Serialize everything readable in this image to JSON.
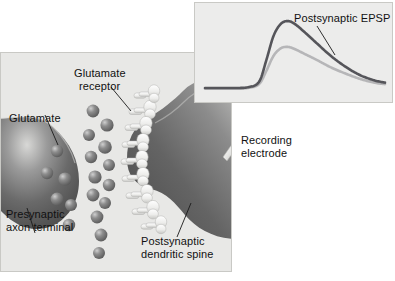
{
  "figure": {
    "background_color": "#ffffff"
  },
  "main_panel": {
    "name": "synapse-diagram",
    "background_color": "#e8e8e6",
    "border_color": "#c9c9c5",
    "labels": {
      "glutamate": "Glutamate",
      "glutamate_receptor_line1": "Glutamate",
      "glutamate_receptor_line2": "receptor",
      "presynaptic_line1": "Presynaptic",
      "presynaptic_line2": "axon terminal",
      "postsynaptic_line1": "Postsynaptic",
      "postsynaptic_line2": "dendritic spine",
      "recording_line1": "Recording",
      "recording_line2": "electrode"
    },
    "structures": {
      "presynaptic_terminal": "presynaptic-axon-terminal",
      "postsynaptic_spine": "postsynaptic-dendritic-spine",
      "synaptic_cleft": "synaptic-cleft",
      "neurotransmitter_count": 19,
      "receptor_count": 9,
      "neurotransmitter_color": "#7d7d7d",
      "receptor_color": "#f2f2f0",
      "membrane_color": "#6e6e6e"
    }
  },
  "inset_panel": {
    "name": "epsp-recording-inset",
    "background_color": "#ececeb",
    "border_color": "#c9c9c5",
    "label": "Postsynaptic EPSP"
  },
  "chart_data": {
    "type": "line",
    "title": "Postsynaptic EPSP",
    "xlabel": "",
    "ylabel": "",
    "grid": false,
    "legend": "annotation-leader-line",
    "xlim": [
      0,
      100
    ],
    "ylim": [
      0,
      100
    ],
    "x": [
      0,
      8,
      16,
      24,
      30,
      34,
      38,
      42,
      46,
      50,
      56,
      62,
      70,
      78,
      86,
      94,
      100
    ],
    "series": [
      {
        "name": "Postsynaptic EPSP (large)",
        "color": "#55555a",
        "linewidth": 2.6,
        "values": [
          4,
          4,
          4,
          5,
          12,
          40,
          72,
          88,
          92,
          88,
          76,
          63,
          46,
          32,
          21,
          14,
          11
        ]
      },
      {
        "name": "Postsynaptic EPSP (small)",
        "color": "#b6b6b8",
        "linewidth": 2.6,
        "values": [
          3,
          3,
          3,
          4,
          9,
          26,
          46,
          56,
          58,
          55,
          48,
          41,
          31,
          23,
          16,
          11,
          9
        ]
      }
    ],
    "annotations": [
      {
        "text": "Postsynaptic EPSP",
        "target_series": "Postsynaptic EPSP (large)"
      }
    ]
  }
}
